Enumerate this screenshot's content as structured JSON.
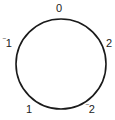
{
  "diagram": {
    "type": "cycle",
    "circle": {
      "cx": 61,
      "cy": 64,
      "r": 45,
      "stroke": "#1a1a1a",
      "stroke_width": 1.6
    },
    "labels": [
      {
        "id": "top",
        "sign": "",
        "value": "0",
        "x": 56,
        "y": 3
      },
      {
        "id": "right",
        "sign": "",
        "value": "2",
        "x": 106,
        "y": 38
      },
      {
        "id": "bottom-right",
        "sign": "‾",
        "value": "2",
        "x": 86,
        "y": 104
      },
      {
        "id": "bottom-left",
        "sign": "",
        "value": "1",
        "x": 26,
        "y": 104
      },
      {
        "id": "left",
        "sign": "‾",
        "value": "1",
        "x": 3,
        "y": 38
      }
    ]
  }
}
